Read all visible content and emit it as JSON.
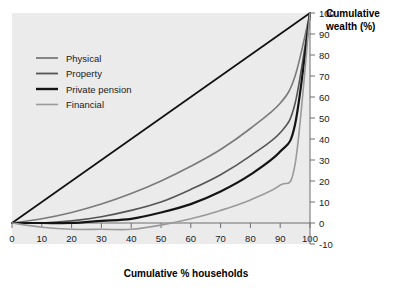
{
  "chart_data": {
    "type": "line",
    "title": "",
    "xlabel": "Cumulative % households",
    "ylabel": "Cumulative wealth (%)",
    "xlim": [
      0,
      100
    ],
    "ylim": [
      -10,
      100
    ],
    "xticks": [
      0,
      10,
      20,
      30,
      40,
      50,
      60,
      70,
      80,
      90,
      100
    ],
    "yticks": [
      -10,
      0,
      10,
      20,
      30,
      40,
      50,
      60,
      70,
      80,
      90,
      100
    ],
    "xtick_labels": [
      "0",
      "10",
      "20",
      "30",
      "40",
      "50",
      "60",
      "70",
      "80",
      "90",
      "100"
    ],
    "ytick_labels": [
      "-10",
      "0",
      "10",
      "20",
      "30",
      "40",
      "50",
      "60",
      "70",
      "80",
      "90",
      "100"
    ],
    "grid": false,
    "legend_position": "upper left",
    "plot_background": "#ebebeb",
    "x": [
      0,
      10,
      20,
      30,
      40,
      50,
      60,
      70,
      80,
      90,
      95,
      100
    ],
    "series": [
      {
        "name": "Physical",
        "color": "#7a7a7a",
        "values": [
          0,
          2,
          5,
          9,
          14,
          20,
          27,
          35,
          45,
          57,
          70,
          100
        ]
      },
      {
        "name": "Property",
        "color": "#555555",
        "values": [
          0,
          0,
          1,
          3,
          6,
          10,
          16,
          23,
          32,
          43,
          57,
          100
        ]
      },
      {
        "name": "Private pension",
        "color": "#141414",
        "values": [
          0,
          0,
          0,
          1,
          2,
          5,
          9,
          15,
          23,
          34,
          47,
          100
        ]
      },
      {
        "name": "Financial",
        "color": "#9a9a9a",
        "values": [
          0,
          -2,
          -3,
          -3,
          -3,
          -1,
          2,
          6,
          11,
          18,
          28,
          100
        ]
      }
    ],
    "equality_line": {
      "name": "line-of-equality",
      "color": "#111111",
      "x": [
        0,
        100
      ],
      "values": [
        0,
        100
      ]
    }
  },
  "legend": {
    "items": [
      {
        "label": "Physical",
        "color": "#7a7a7a",
        "width": 1.8
      },
      {
        "label": "Property",
        "color": "#555555",
        "width": 1.8
      },
      {
        "label": "Private pension",
        "color": "#141414",
        "width": 2.4
      },
      {
        "label": "Financial",
        "color": "#9a9a9a",
        "width": 1.6
      }
    ]
  },
  "axes": {
    "x_title": "Cumulative % households",
    "y_title_line1": "Cumulative",
    "y_title_line2": "wealth (%)"
  }
}
